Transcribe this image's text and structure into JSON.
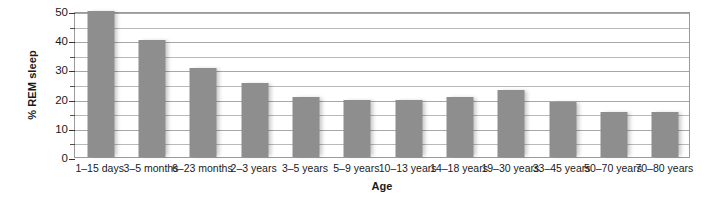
{
  "chart_data": {
    "type": "bar",
    "title": "",
    "xlabel": "Age",
    "ylabel": "% REM sleep",
    "ylim": [
      0,
      50
    ],
    "ytick_step": 10,
    "minor_tick_step": 5,
    "grid": true,
    "legend": "none",
    "bar_color": "#8e8e8e",
    "categories": [
      "1–15 days",
      "3–5 months",
      "6–23 months",
      "2–3 years",
      "3–5 years",
      "5–9 years",
      "10–13 years",
      "14–18 years",
      "19–30 years",
      "33–45 years",
      "50–70 years",
      "70–80 years"
    ],
    "values": [
      50,
      40,
      30.5,
      25.5,
      20.5,
      19.5,
      19.5,
      20.5,
      23,
      19,
      15.5,
      15.5
    ],
    "ytick_labels": [
      "0",
      "10",
      "20",
      "30",
      "40",
      "50"
    ],
    "ytick_values": [
      0,
      10,
      20,
      30,
      40,
      50
    ],
    "minor_tick_values": [
      5,
      15,
      25,
      35,
      45
    ],
    "gridline_values": [
      5,
      10,
      15,
      20,
      25,
      30,
      35,
      40,
      45,
      50
    ]
  }
}
